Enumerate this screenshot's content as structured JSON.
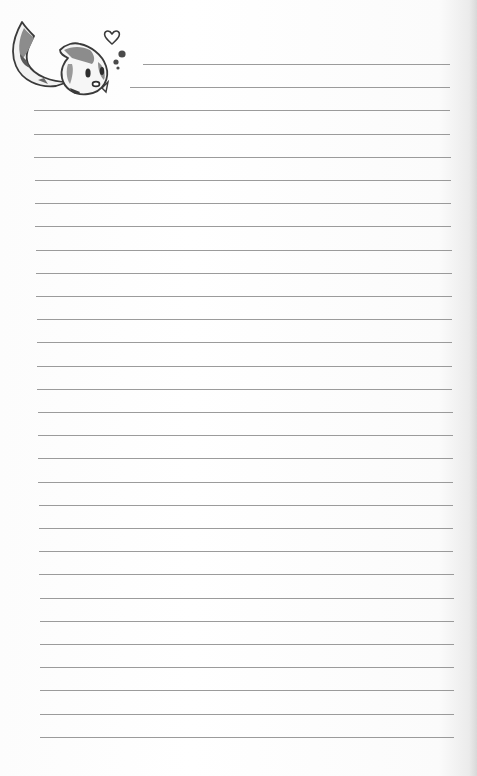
{
  "page": {
    "type": "lined-stationery",
    "background_color": "#ffffff",
    "line_color": "#8a8a8a",
    "line_count": 30,
    "line_spacing_px": 23.2,
    "first_line_y": 64,
    "lines": [
      {
        "x1": 143,
        "x2": 450
      },
      {
        "x1": 130,
        "x2": 450
      },
      {
        "x1": 34,
        "x2": 450
      },
      {
        "x1": 34,
        "x2": 450
      },
      {
        "x1": 34,
        "x2": 451
      },
      {
        "x1": 35,
        "x2": 451
      },
      {
        "x1": 35,
        "x2": 451
      },
      {
        "x1": 35,
        "x2": 451
      },
      {
        "x1": 36,
        "x2": 452
      },
      {
        "x1": 36,
        "x2": 452
      },
      {
        "x1": 36,
        "x2": 452
      },
      {
        "x1": 37,
        "x2": 452
      },
      {
        "x1": 37,
        "x2": 452
      },
      {
        "x1": 37,
        "x2": 452
      },
      {
        "x1": 37,
        "x2": 452
      },
      {
        "x1": 38,
        "x2": 453
      },
      {
        "x1": 38,
        "x2": 453
      },
      {
        "x1": 38,
        "x2": 453
      },
      {
        "x1": 38,
        "x2": 453
      },
      {
        "x1": 39,
        "x2": 453
      },
      {
        "x1": 39,
        "x2": 453
      },
      {
        "x1": 39,
        "x2": 453
      },
      {
        "x1": 39,
        "x2": 454
      },
      {
        "x1": 40,
        "x2": 454
      },
      {
        "x1": 40,
        "x2": 454
      },
      {
        "x1": 40,
        "x2": 454
      },
      {
        "x1": 40,
        "x2": 454
      },
      {
        "x1": 40,
        "x2": 454
      },
      {
        "x1": 40,
        "x2": 454
      },
      {
        "x1": 40,
        "x2": 454
      }
    ]
  },
  "illustration": {
    "subject": "cute-fish-creature",
    "elements": [
      "curled-tail",
      "spotted-round-body",
      "dot-eyes",
      "open-mouth",
      "heart",
      "bubbles"
    ],
    "colors": {
      "outline": "#3a3a3a",
      "spots": "#8c8c8c",
      "body": "#f4f4f4"
    }
  }
}
